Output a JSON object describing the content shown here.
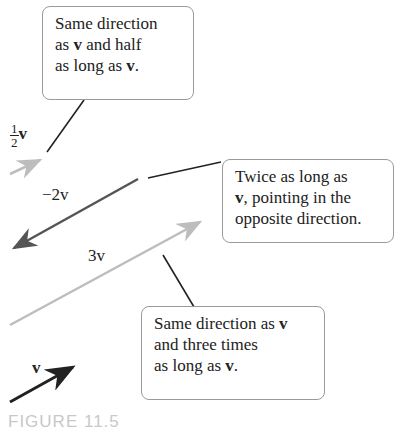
{
  "figure": {
    "caption": "FIGURE 11.5",
    "callouts": [
      {
        "id": "half",
        "lines": [
          "Same direction",
          "as v and half",
          "as long as v."
        ]
      },
      {
        "id": "neg2",
        "lines": [
          "Twice as long as",
          "v, pointing in the",
          "opposite direction."
        ]
      },
      {
        "id": "three",
        "lines": [
          "Same direction as v",
          "and three times",
          "as long as v."
        ]
      }
    ],
    "vector_labels": {
      "half_num": "1",
      "half_den": "2",
      "half_v": "v",
      "neg2": "−2v",
      "three": "3v",
      "v": "v"
    },
    "colors": {
      "v": "#222222",
      "half": "#bdbdbd",
      "neg2": "#555555",
      "three": "#bdbdbd",
      "leader": "#222222",
      "border": "#9a9a9a"
    }
  }
}
